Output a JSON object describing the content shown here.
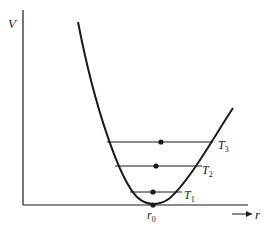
{
  "diagram": {
    "title": "",
    "type": "potential-energy-well",
    "axes": {
      "y_label": "V",
      "x_label": "r",
      "origin_marker": {
        "main": "r",
        "sub": "0"
      }
    },
    "levels": [
      {
        "label": "T",
        "sub": "1",
        "y": 192,
        "x1": 130,
        "x2": 182,
        "dot_x": 153
      },
      {
        "label": "T",
        "sub": "2",
        "y": 166,
        "x1": 115,
        "x2": 202,
        "dot_x": 156
      },
      {
        "label": "T",
        "sub": "3",
        "y": 142,
        "x1": 107,
        "x2": 213,
        "dot_x": 161
      }
    ],
    "minimum_point": {
      "x": 153,
      "y": 205
    },
    "colors": {
      "ink": "#1a1a1a",
      "background": "#ffffff"
    }
  }
}
